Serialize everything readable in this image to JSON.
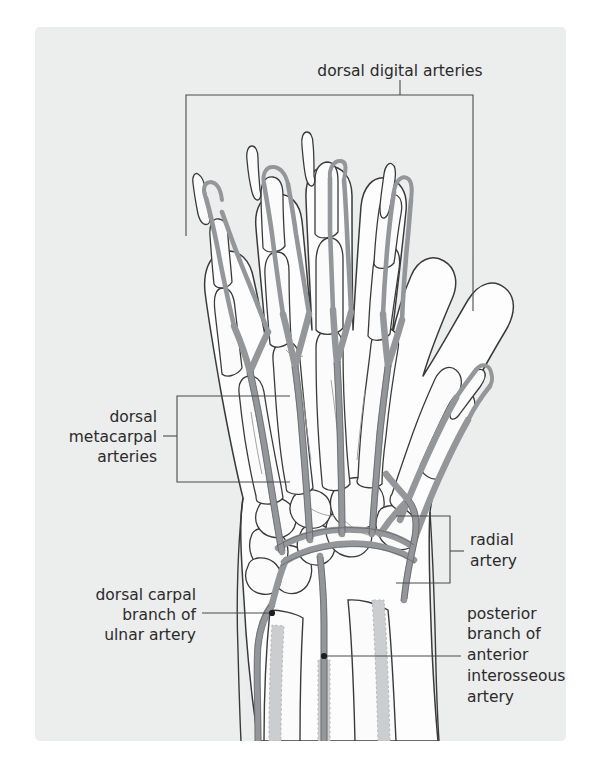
{
  "figure": {
    "panel_bg": "#eceded",
    "page_bg": "#ffffff",
    "artery_fill": "#949699",
    "artery_stroke": "#5d5f61",
    "bone_fill": "#fbfbfb",
    "bone_stroke": "#3a3a3a",
    "deep_artery_fill": "#c9cbcc",
    "leader_color": "#4a4a4a",
    "text_color": "#2b2b2b"
  },
  "labels": {
    "dorsal_digital": {
      "lines": [
        "dorsal digital arteries"
      ],
      "anchor": "top-center"
    },
    "dorsal_metacarpal": {
      "lines": [
        "dorsal",
        "metacarpal",
        "arteries"
      ],
      "anchor": "left"
    },
    "radial": {
      "lines": [
        "radial",
        "artery"
      ],
      "anchor": "right"
    },
    "dorsal_carpal_ulnar": {
      "lines": [
        "dorsal carpal",
        "branch of",
        "ulnar artery"
      ],
      "anchor": "left"
    },
    "posterior_interosseous": {
      "lines": [
        "posterior",
        "branch of",
        "anterior",
        "interosseous",
        "artery"
      ],
      "anchor": "right"
    }
  }
}
